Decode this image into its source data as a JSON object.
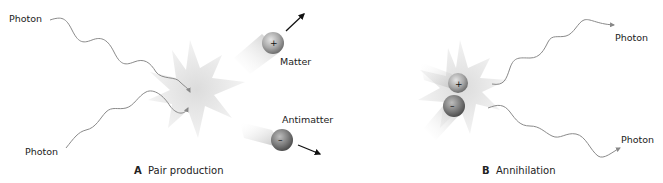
{
  "panel_a": {
    "letter": "A",
    "caption": "Pair production",
    "photon_top_label": "Photon",
    "photon_bottom_label": "Photon",
    "matter_label": "Matter",
    "antimatter_label": "Antimatter",
    "matter_sign": "+",
    "antimatter_sign": "–"
  },
  "panel_b": {
    "letter": "B",
    "caption": "Annihilation",
    "photon_top_label": "Photon",
    "photon_bottom_label": "Photon",
    "positive_sign": "+",
    "negative_sign": "–"
  },
  "colors": {
    "photon_line": "#8a8a8a",
    "burst": "#e6e6e6",
    "particle": "#9a9a9a",
    "arrow": "#111111",
    "text": "#222222"
  }
}
